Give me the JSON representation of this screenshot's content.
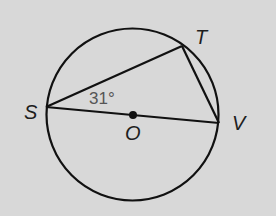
{
  "diagram": {
    "type": "circle-geometry",
    "colors": {
      "background": "#d8d8d8",
      "stroke": "#111111",
      "angle_text": "#555555"
    },
    "circle": {
      "center_label": "O",
      "cx": 132.5,
      "cy": 114.5,
      "r": 86
    },
    "points": {
      "S": {
        "label": "S",
        "x": 46,
        "y": 107
      },
      "T": {
        "label": "T",
        "x": 182,
        "y": 46
      },
      "V": {
        "label": "V",
        "x": 219,
        "y": 123
      },
      "O": {
        "label": "O",
        "x": 133,
        "y": 115
      }
    },
    "segments": [
      {
        "from": "S",
        "to": "T"
      },
      {
        "from": "T",
        "to": "V"
      },
      {
        "from": "S",
        "to": "V",
        "note": "diameter through O"
      }
    ],
    "angle_label": {
      "vertex": "S",
      "text": "31°"
    }
  }
}
